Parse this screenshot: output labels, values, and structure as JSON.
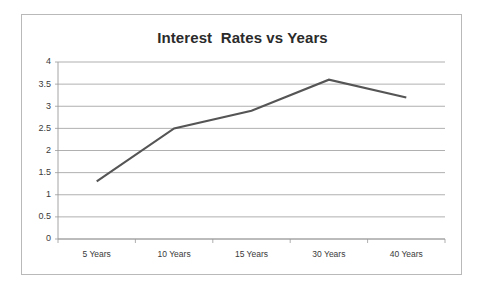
{
  "chart_data": {
    "type": "line",
    "title": "Interest  Rates vs Years",
    "xlabel": "",
    "ylabel": "",
    "categories": [
      "5 Years",
      "10 Years",
      "15 Years",
      "30 Years",
      "40 Years"
    ],
    "values": [
      1.3,
      2.5,
      2.9,
      3.6,
      3.2
    ],
    "series": [
      {
        "name": "Interest Rate",
        "values": [
          1.3,
          2.5,
          2.9,
          3.6,
          3.2
        ],
        "color": "#555555"
      }
    ],
    "ylim": [
      0,
      4
    ],
    "ytick_labels": [
      "0",
      "0.5",
      "1",
      "1.5",
      "2",
      "2.5",
      "3",
      "3.5",
      "4"
    ],
    "ytick_values": [
      0,
      0.5,
      1,
      1.5,
      2,
      2.5,
      3,
      3.5,
      4
    ],
    "grid": true,
    "grid_axis": "y",
    "legend": false,
    "legend_position": "none",
    "markers": false,
    "line_color": "#555555",
    "grid_color": "#8e8e8e",
    "axis_color": "#9a9a9a",
    "border_color": "#b9b9b9",
    "background_color": "#ffffff",
    "title_color": "#2b2b2b"
  }
}
